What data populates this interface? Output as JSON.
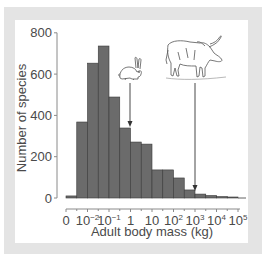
{
  "chart_data": {
    "type": "bar",
    "title": "",
    "xlabel": "Adult body mass (kg)",
    "ylabel": "Number of species",
    "ylim": [
      0,
      800
    ],
    "yticks": [
      0,
      200,
      400,
      600,
      800
    ],
    "xtick_labels": [
      "0",
      "10-2",
      "10-1",
      "1",
      "10",
      "102",
      "103",
      "104",
      "105"
    ],
    "grid": false,
    "legend": null,
    "bin_width_log10": 0.5,
    "categories": [
      "0 to 10^-2.5",
      "10^-2.5 to 10^-2",
      "10^-2 to 10^-1.5",
      "10^-1.5 to 10^-1",
      "10^-1 to 10^-0.5",
      "10^-0.5 to 1",
      "1 to 10^0.5",
      "10^0.5 to 10",
      "10 to 10^1.5",
      "10^1.5 to 10^2",
      "10^2 to 10^2.5",
      "10^2.5 to 10^3",
      "10^3 to 10^3.5",
      "10^3.5 to 10^4",
      "10^4 to 10^4.5",
      "10^4.5 to 10^5"
    ],
    "values": [
      10,
      368,
      653,
      736,
      489,
      339,
      271,
      261,
      136,
      136,
      97,
      39,
      19,
      12,
      7,
      2
    ],
    "bar_color": "#6b6b6b",
    "annotations": [
      {
        "label": "rabbit-illustration",
        "arrow_x": "1 kg (approx 10^0)",
        "text": ""
      },
      {
        "label": "water-buffalo-illustration",
        "arrow_x": "10^3 kg",
        "text": ""
      }
    ]
  },
  "axes": {
    "y_ticks": [
      "0",
      "200",
      "400",
      "600",
      "800"
    ],
    "x_ticks": [
      {
        "base": "0",
        "exp": ""
      },
      {
        "base": "10",
        "exp": "-2"
      },
      {
        "base": "10",
        "exp": "-1"
      },
      {
        "base": "1",
        "exp": ""
      },
      {
        "base": "10",
        "exp": ""
      },
      {
        "base": "10",
        "exp": "2"
      },
      {
        "base": "10",
        "exp": "3"
      },
      {
        "base": "10",
        "exp": "4"
      },
      {
        "base": "10",
        "exp": "5"
      }
    ],
    "x_title": "Adult body mass (kg)",
    "y_title": "Number of species"
  },
  "colors": {
    "frame": "#e4e4e4",
    "bar_fill": "#6b6b6b",
    "bar_stroke": "#3a3a3a",
    "axis": "#8a8a8a",
    "text": "#4a4a4a"
  }
}
